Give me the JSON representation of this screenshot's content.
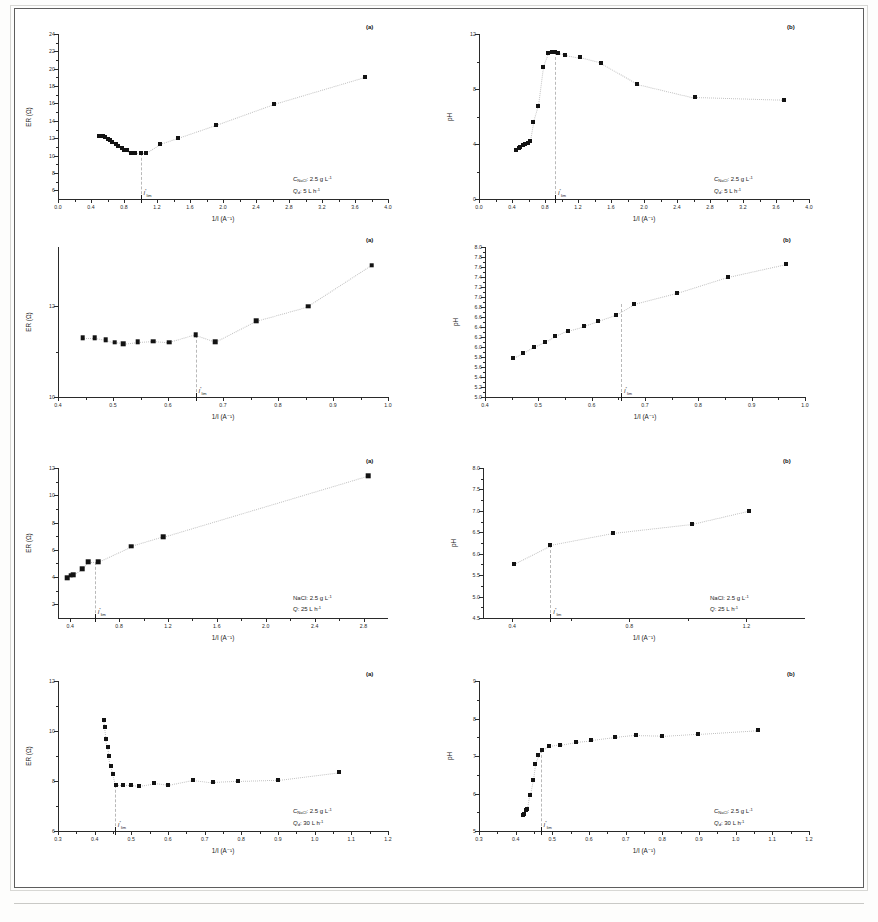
{
  "figure": {
    "panel_count": 8,
    "rows": 4,
    "columns": 2,
    "axis_labels": {
      "x": "1/I (A⁻¹)",
      "y_left": "ER (Ω)",
      "y_right": "pH"
    },
    "critical_marker": "I*lim"
  },
  "chart_data": [
    {
      "id": "r1a",
      "type": "scatter",
      "title": "(a)",
      "xlabel": "1/I (A⁻¹)",
      "ylabel": "ER (Ω)",
      "xlim": [
        0.0,
        4.0
      ],
      "ylim": [
        5.0,
        24.0
      ],
      "xticks": [
        0.0,
        0.4,
        0.8,
        1.2,
        1.6,
        2.0,
        2.4,
        2.8,
        3.2,
        3.6,
        4.0
      ],
      "yticks": [
        6,
        8,
        10,
        12,
        14,
        16,
        18,
        20,
        22,
        24
      ],
      "grid": false,
      "legend": "none",
      "annotations": {
        "concentration": "C",
        "concentration_sub": "NaCl",
        "concentration_value": ": 2.5 g L",
        "concentration_sup": "-1",
        "flow": "Q",
        "flow_sub": "d",
        "flow_value": ": 5 L h",
        "flow_sup": "-1",
        "critical_x": 1.0
      },
      "x": [
        0.5,
        0.54,
        0.57,
        0.6,
        0.63,
        0.66,
        0.7,
        0.73,
        0.77,
        0.8,
        0.84,
        0.88,
        0.93,
        1.0,
        1.07,
        1.24,
        1.46,
        1.92,
        2.62,
        3.72
      ],
      "y": [
        12.3,
        12.3,
        12.1,
        11.9,
        11.8,
        11.6,
        11.3,
        11.1,
        10.9,
        10.7,
        10.7,
        10.3,
        10.3,
        10.3,
        10.3,
        11.3,
        12.0,
        13.5,
        15.9,
        19.0
      ]
    },
    {
      "id": "r1b",
      "type": "scatter",
      "title": "(b)",
      "xlabel": "1/I (A⁻¹)",
      "ylabel": "pH",
      "xlim": [
        0.0,
        4.0
      ],
      "ylim": [
        0.0,
        12.0
      ],
      "xticks": [
        0.0,
        0.4,
        0.8,
        1.2,
        1.6,
        2.0,
        2.4,
        2.8,
        3.2,
        3.6,
        4.0
      ],
      "yticks": [
        0,
        4,
        8,
        12
      ],
      "grid": false,
      "legend": "none",
      "annotations": {
        "concentration": "C",
        "concentration_sub": "NaCl",
        "concentration_value": ": 2.5 g L",
        "concentration_sup": "-1",
        "flow": "Q",
        "flow_sub": "d",
        "flow_value": ": 5 L h",
        "flow_sup": "-1",
        "critical_x": 0.92
      },
      "x": [
        0.45,
        0.48,
        0.5,
        0.53,
        0.56,
        0.59,
        0.62,
        0.66,
        0.72,
        0.78,
        0.84,
        0.88,
        0.92,
        0.96,
        1.04,
        1.22,
        1.48,
        1.92,
        2.62,
        3.7
      ],
      "y": [
        3.6,
        3.7,
        3.8,
        3.9,
        4.0,
        4.1,
        4.2,
        5.6,
        6.8,
        9.6,
        10.6,
        10.7,
        10.7,
        10.6,
        10.5,
        10.3,
        9.9,
        8.4,
        7.4,
        7.2
      ]
    },
    {
      "id": "r2a",
      "type": "scatter",
      "title": "(a)",
      "xlabel": "1/I (A⁻¹)",
      "ylabel": "ER (Ω)",
      "xlim": [
        0.4,
        1.0
      ],
      "ylim": [
        10.0,
        13.3
      ],
      "xticks": [
        0.4,
        0.5,
        0.6,
        0.7,
        0.8,
        0.9,
        1.0
      ],
      "yticks": [
        10,
        12
      ],
      "grid": false,
      "legend": "none",
      "annotations": {
        "critical_x": 0.65
      },
      "x": [
        0.445,
        0.467,
        0.487,
        0.503,
        0.519,
        0.545,
        0.573,
        0.602,
        0.65,
        0.686,
        0.76,
        0.855,
        0.97
      ],
      "y": [
        11.3,
        11.3,
        11.26,
        11.2,
        11.17,
        11.21,
        11.23,
        11.2,
        11.37,
        11.22,
        11.68,
        12.0,
        12.9
      ]
    },
    {
      "id": "r2b",
      "type": "scatter",
      "title": "(b)",
      "xlabel": "1/I (A⁻¹)",
      "ylabel": "pH",
      "xlim": [
        0.4,
        1.0
      ],
      "ylim": [
        5.0,
        8.0
      ],
      "xticks": [
        0.4,
        0.5,
        0.6,
        0.7,
        0.8,
        0.9,
        1.0
      ],
      "yticks": [
        5.0,
        5.2,
        5.4,
        5.6,
        5.8,
        6.0,
        6.2,
        6.4,
        6.6,
        6.8,
        7.0,
        7.2,
        7.4,
        7.6,
        7.8,
        8.0
      ],
      "grid": false,
      "legend": "none",
      "annotations": {
        "critical_x": 0.655
      },
      "x": [
        0.452,
        0.472,
        0.492,
        0.512,
        0.532,
        0.556,
        0.585,
        0.612,
        0.645,
        0.68,
        0.76,
        0.855,
        0.965
      ],
      "y": [
        5.78,
        5.88,
        6.0,
        6.1,
        6.22,
        6.33,
        6.42,
        6.52,
        6.64,
        6.86,
        7.08,
        7.4,
        7.66
      ]
    },
    {
      "id": "r3a",
      "type": "scatter",
      "title": "(a)",
      "xlabel": "1/I (A⁻¹)",
      "ylabel": "ER (Ω)",
      "xlim": [
        0.3,
        3.0
      ],
      "ylim": [
        1.0,
        12.0
      ],
      "xticks": [
        0.4,
        0.8,
        1.2,
        1.6,
        2.0,
        2.4,
        2.8
      ],
      "yticks": [
        2,
        4,
        6,
        8,
        10,
        12
      ],
      "grid": false,
      "legend": "none",
      "annotations": {
        "concentration": "NaCl: 2.5 g L",
        "concentration_sup": "-1",
        "flow": "Q",
        "flow_value": ": 25 L h",
        "flow_sup": "-1",
        "critical_x": 0.6
      },
      "x": [
        0.375,
        0.405,
        0.425,
        0.497,
        0.547,
        0.627,
        0.9,
        1.16,
        2.84
      ],
      "y": [
        3.95,
        4.12,
        4.18,
        4.6,
        5.12,
        5.12,
        6.25,
        6.95,
        11.45
      ]
    },
    {
      "id": "r3b",
      "type": "scatter",
      "title": "(b)",
      "xlabel": "1/I (A⁻¹)",
      "ylabel": "pH",
      "xlim": [
        0.3,
        1.4
      ],
      "ylim": [
        4.5,
        8.0
      ],
      "xticks": [
        0.4,
        0.8,
        1.2
      ],
      "yticks": [
        4.5,
        5.0,
        5.5,
        6.0,
        6.5,
        7.0,
        7.5,
        8.0
      ],
      "grid": false,
      "legend": "none",
      "annotations": {
        "concentration": "NaCl: 2.5 g L",
        "concentration_sup": "-1",
        "flow": "Q",
        "flow_value": ": 25 L h",
        "flow_sup": "-1",
        "critical_x": 0.53
      },
      "x": [
        0.405,
        0.53,
        0.745,
        1.015,
        1.21
      ],
      "y": [
        5.77,
        6.2,
        6.48,
        6.69,
        7.0
      ]
    },
    {
      "id": "r4a",
      "type": "scatter",
      "title": "(a)",
      "xlabel": "1/I (A⁻¹)",
      "ylabel": "ER (Ω)",
      "xlim": [
        0.3,
        1.2
      ],
      "ylim": [
        6.0,
        12.0
      ],
      "xticks": [
        0.3,
        0.4,
        0.5,
        0.6,
        0.7,
        0.8,
        0.9,
        1.0,
        1.1,
        1.2
      ],
      "yticks": [
        6,
        8,
        10,
        12
      ],
      "grid": false,
      "legend": "none",
      "annotations": {
        "concentration": "C",
        "concentration_sub": "NaCl",
        "concentration_value": ": 2.5 g L",
        "concentration_sup": "-1",
        "flow": "Q",
        "flow_sub": "d",
        "flow_value": ": 30 L h",
        "flow_sup": "-1",
        "critical_x": 0.455
      },
      "x": [
        0.425,
        0.428,
        0.432,
        0.436,
        0.44,
        0.444,
        0.45,
        0.458,
        0.478,
        0.5,
        0.52,
        0.562,
        0.6,
        0.668,
        0.722,
        0.79,
        0.9,
        1.065
      ],
      "y": [
        10.45,
        10.18,
        9.7,
        9.35,
        9.0,
        8.6,
        8.3,
        7.85,
        7.85,
        7.85,
        7.82,
        7.92,
        7.85,
        8.05,
        7.95,
        8.0,
        8.05,
        8.35
      ]
    },
    {
      "id": "r4b",
      "type": "scatter",
      "title": "(b)",
      "xlabel": "1/I (A⁻¹)",
      "ylabel": "pH",
      "xlim": [
        0.3,
        1.2
      ],
      "ylim": [
        5.0,
        9.0
      ],
      "xticks": [
        0.3,
        0.4,
        0.5,
        0.6,
        0.7,
        0.8,
        0.9,
        1.0,
        1.1,
        1.2
      ],
      "yticks": [
        5,
        6,
        7,
        8,
        9
      ],
      "grid": false,
      "legend": "none",
      "annotations": {
        "concentration": "C",
        "concentration_sub": "NaCl",
        "concentration_value": ": 2.5 g L",
        "concentration_sup": "-1",
        "flow": "Q",
        "flow_sub": "d",
        "flow_value": ": 30 L h",
        "flow_sup": "-1",
        "critical_x": 0.468
      },
      "x": [
        0.42,
        0.424,
        0.428,
        0.432,
        0.438,
        0.446,
        0.452,
        0.462,
        0.472,
        0.492,
        0.52,
        0.565,
        0.605,
        0.672,
        0.728,
        0.8,
        0.898,
        1.062
      ],
      "y": [
        5.42,
        5.46,
        5.56,
        5.6,
        5.95,
        6.35,
        6.78,
        7.02,
        7.15,
        7.26,
        7.3,
        7.38,
        7.42,
        7.5,
        7.56,
        7.54,
        7.6,
        7.7
      ]
    }
  ]
}
